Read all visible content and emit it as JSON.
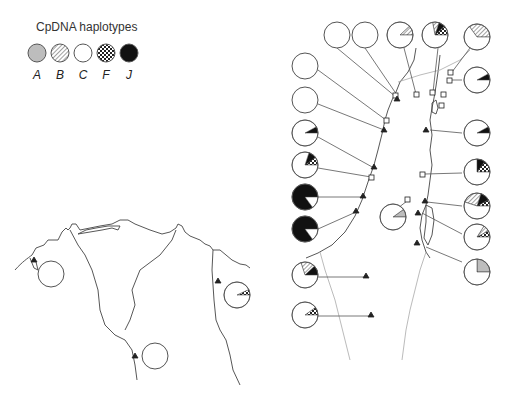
{
  "legend": {
    "title": "CpDNA haplotypes",
    "items": [
      {
        "key": "A",
        "label": "A",
        "fill": "#bdbdbd",
        "pattern": "solid-grey"
      },
      {
        "key": "B",
        "label": "B",
        "fill": "#ffffff",
        "pattern": "diagonal-hatch"
      },
      {
        "key": "C",
        "label": "C",
        "fill": "#ffffff",
        "pattern": "white"
      },
      {
        "key": "F",
        "label": "F",
        "fill": "#222222",
        "pattern": "checker"
      },
      {
        "key": "J",
        "label": "J",
        "fill": "#111111",
        "pattern": "solid-black"
      }
    ]
  },
  "colors": {
    "outline": "#555555",
    "coast": "#444444",
    "border": "#aaaaaa",
    "marker": "#222222"
  },
  "chart_data": {
    "type": "pie",
    "title": "CpDNA haplotypes",
    "legend": [
      "A",
      "B",
      "C",
      "F",
      "J"
    ],
    "pies": [
      {
        "id": "p1",
        "cx": 337,
        "cy": 35,
        "slices": {
          "C": 1.0
        }
      },
      {
        "id": "p2",
        "cx": 365,
        "cy": 35,
        "slices": {
          "C": 1.0
        }
      },
      {
        "id": "p3",
        "cx": 400,
        "cy": 35,
        "slices": {
          "B": 0.12,
          "C": 0.88
        }
      },
      {
        "id": "p4",
        "cx": 435,
        "cy": 35,
        "slices": {
          "F": 0.12,
          "J": 0.08,
          "B": 0.08,
          "C": 0.72
        }
      },
      {
        "id": "p5",
        "cx": 477,
        "cy": 37,
        "slices": {
          "B": 0.35,
          "C": 0.65
        }
      },
      {
        "id": "p6",
        "cx": 305,
        "cy": 66,
        "slices": {
          "C": 1.0
        }
      },
      {
        "id": "p7",
        "cx": 305,
        "cy": 100,
        "slices": {
          "C": 1.0
        }
      },
      {
        "id": "p8",
        "cx": 477,
        "cy": 80,
        "slices": {
          "J": 0.08,
          "C": 0.92
        }
      },
      {
        "id": "p9",
        "cx": 305,
        "cy": 133,
        "slices": {
          "J": 0.08,
          "C": 0.92
        }
      },
      {
        "id": "p10",
        "cx": 477,
        "cy": 133,
        "slices": {
          "J": 0.08,
          "C": 0.92
        }
      },
      {
        "id": "p11",
        "cx": 305,
        "cy": 165,
        "slices": {
          "F": 0.1,
          "J": 0.1,
          "C": 0.8
        }
      },
      {
        "id": "p12",
        "cx": 477,
        "cy": 172,
        "slices": {
          "F": 0.15,
          "J": 0.1,
          "C": 0.75
        }
      },
      {
        "id": "p13",
        "cx": 305,
        "cy": 197,
        "slices": {
          "J": 0.85,
          "C": 0.15
        }
      },
      {
        "id": "p14",
        "cx": 477,
        "cy": 206,
        "slices": {
          "F": 0.08,
          "J": 0.12,
          "B": 0.25,
          "C": 0.55
        }
      },
      {
        "id": "p15",
        "cx": 393,
        "cy": 217,
        "slices": {
          "C": 0.9,
          "A": 0.1
        }
      },
      {
        "id": "p16",
        "cx": 305,
        "cy": 229,
        "slices": {
          "J": 0.85,
          "C": 0.15
        }
      },
      {
        "id": "p17",
        "cx": 477,
        "cy": 237,
        "slices": {
          "F": 0.08,
          "B": 0.08,
          "C": 0.84
        }
      },
      {
        "id": "p18",
        "cx": 477,
        "cy": 272,
        "slices": {
          "A": 0.25,
          "C": 0.75
        }
      },
      {
        "id": "p19",
        "cx": 305,
        "cy": 275,
        "slices": {
          "J": 0.12,
          "B": 0.18,
          "C": 0.7
        }
      },
      {
        "id": "p20",
        "cx": 305,
        "cy": 315,
        "slices": {
          "F": 0.1,
          "C": 0.9
        }
      },
      {
        "id": "p21",
        "cx": 51,
        "cy": 274,
        "slices": {
          "C": 1.0
        }
      },
      {
        "id": "p22",
        "cx": 237,
        "cy": 295,
        "slices": {
          "F": 0.07,
          "C": 0.93
        }
      },
      {
        "id": "p23",
        "cx": 155,
        "cy": 356,
        "slices": {
          "C": 1.0
        }
      }
    ]
  }
}
